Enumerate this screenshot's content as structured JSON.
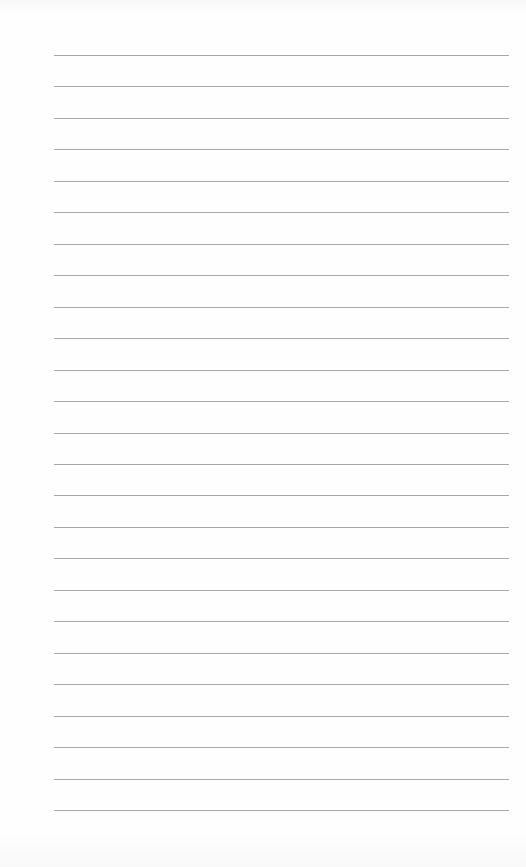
{
  "page": {
    "type": "lined-paper",
    "background_color": "#fefefe",
    "rule_color": "#9a9a9a",
    "rule_count": 25,
    "rule_start_y": 55,
    "rule_spacing": 31.46,
    "rule_left_x": 54,
    "rule_right_x": 509
  }
}
